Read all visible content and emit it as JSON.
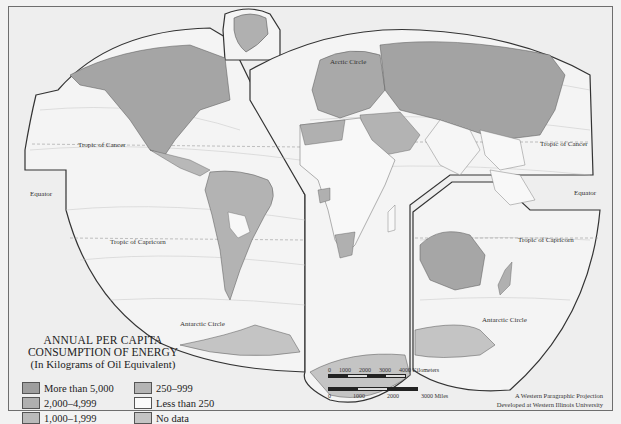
{
  "map": {
    "projection": "Western Paragraphic Projection",
    "colors": {
      "ocean": "#f4f4f4",
      "land_more_than_5000": "#a3a3a3",
      "land_2000_4999": "#b3b3b3",
      "land_1000_1999": "#bcbcbc",
      "land_250_999": "#b8b8b8",
      "land_less_than_250": "#f8f8f8",
      "land_no_data": "#c6c6c6",
      "graticule": "#bdbdbd",
      "border": "#333333"
    },
    "labels": {
      "tropic_cancer_west": "Tropic of Cancer",
      "tropic_cancer_east": "Tropic of Cancer",
      "tropic_capricorn_west": "Tropic of Capricorn",
      "tropic_capricorn_east": "Tropic of Capricorn",
      "arctic_circle": "Arctic Circle",
      "antarctic_circle_west": "Antarctic Circle",
      "antarctic_circle_east": "Antarctic Circle",
      "equator_west": "Equator",
      "equator_east": "Equator"
    },
    "lat_ticks_west": [
      "50",
      "40",
      "30",
      "20",
      "10",
      "0",
      "10",
      "20",
      "30",
      "40",
      "50",
      "60",
      "70",
      "80"
    ],
    "lon_ticks_equator_west": [
      "140",
      "150",
      "140",
      "130",
      "120",
      "110",
      "100",
      "90"
    ],
    "lat_ticks_east": [
      "60",
      "50",
      "40",
      "30",
      "20",
      "10",
      "0",
      "10",
      "20",
      "30",
      "40",
      "50",
      "60",
      "70",
      "80"
    ],
    "lon_ticks_east_pacific": [
      "110",
      "120",
      "130",
      "140",
      "150",
      "160",
      "170",
      "180",
      "170",
      "160"
    ],
    "lon_ticks_australia": [
      "60",
      "70",
      "90",
      "130",
      "140",
      "120"
    ],
    "top_ticks": [
      "80",
      "70",
      "60",
      "80",
      "70",
      "80",
      "70",
      "60"
    ],
    "greenland_ticks": [
      "80",
      "70",
      "60",
      "50",
      "40",
      "30",
      "20"
    ]
  },
  "legend": {
    "title_line1": "ANNUAL PER CAPITA",
    "title_line2": "CONSUMPTION OF ENERGY",
    "title_line3": "(In Kilograms of Oil Equivalent)",
    "items": [
      {
        "label": "More than 5,000",
        "color": "#9e9e9e"
      },
      {
        "label": "250–999",
        "color": "#b4b4b4"
      },
      {
        "label": "2,000–4,999",
        "color": "#b0b0b0"
      },
      {
        "label": "Less than 250",
        "color": "#fafafa"
      },
      {
        "label": "1,000–1,999",
        "color": "#bababa"
      },
      {
        "label": "No data",
        "color": "#c4c4c4"
      }
    ]
  },
  "scale": {
    "km_ticks": [
      "0",
      "1000",
      "2000",
      "3000",
      "4000 Kilometers"
    ],
    "mi_ticks": [
      "0",
      "1000",
      "2000",
      "3000 Miles"
    ]
  },
  "credit": {
    "line1": "A Western Paragraphic Projection",
    "line2": "Developed at Western Illinois University"
  }
}
